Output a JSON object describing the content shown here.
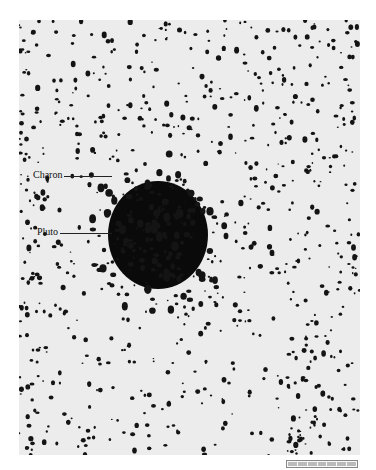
{
  "image": {
    "subject": "Telescope photograph of Pluto and Charon",
    "labels": [
      {
        "text": "Charon",
        "x": 33,
        "y": 176,
        "leader_to_x": 112
      },
      {
        "text": "Pluto",
        "x": 37,
        "y": 233,
        "leader_to_x": 112
      }
    ],
    "colors": {
      "background": "#ececec",
      "grain": "#111111"
    },
    "blob": {
      "cx": 158,
      "cy": 235,
      "rx": 58,
      "ry": 64
    }
  }
}
